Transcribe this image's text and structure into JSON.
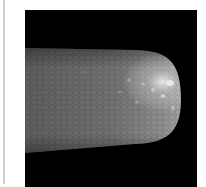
{
  "figure": {
    "background_color": "#000000",
    "specimen_color": "#7a7a7a",
    "tip_highlight_color": "#e8e8e8"
  },
  "frame": {
    "rule_color": "#cfcfcf"
  }
}
